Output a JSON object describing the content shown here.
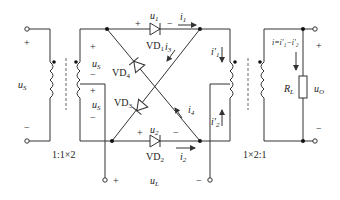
{
  "diagram": {
    "input": {
      "voltage": "u",
      "voltage_sub": "S",
      "plus": "+",
      "minus": "−"
    },
    "transformer_left": {
      "ratio": "1:1×2"
    },
    "secondary_top": {
      "voltage": "u",
      "voltage_sub": "S",
      "plus": "+",
      "minus": "−"
    },
    "secondary_bottom": {
      "voltage": "u",
      "voltage_sub": "S",
      "plus": "+",
      "minus": "−"
    },
    "diodes": [
      {
        "label": "VD",
        "sub": "1",
        "voltage": "u",
        "voltage_sub": "1",
        "plus": "+",
        "minus": "−"
      },
      {
        "label": "VD",
        "sub": "2",
        "voltage": "u",
        "voltage_sub": "2",
        "plus": "+",
        "minus": "−"
      },
      {
        "label": "VD",
        "sub": "3"
      },
      {
        "label": "VD",
        "sub": "4"
      }
    ],
    "currents": {
      "i1": {
        "name": "i",
        "sub": "1"
      },
      "i2": {
        "name": "i",
        "sub": "2"
      },
      "i3": {
        "name": "i",
        "sub": "3"
      },
      "i4": {
        "name": "i",
        "sub": "4"
      },
      "i1p": {
        "name": "i′",
        "sub": "1"
      },
      "i2p": {
        "name": "i′",
        "sub": "2"
      }
    },
    "load_terminals": {
      "voltage": "u",
      "voltage_sub": "L",
      "plus": "+",
      "minus": "−"
    },
    "transformer_right": {
      "ratio": "1×2:1"
    },
    "output": {
      "current_eq": "i=i′₁−i′₂",
      "resistor": "R",
      "resistor_sub": "L",
      "voltage": "u",
      "voltage_sub": "O",
      "plus": "+",
      "minus": "−"
    }
  }
}
